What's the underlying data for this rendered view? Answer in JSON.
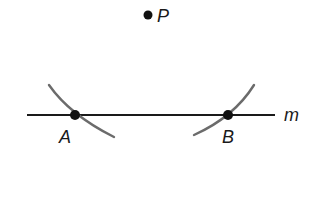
{
  "diagram": {
    "line": {
      "label": "m",
      "x1": 27,
      "y1": 115,
      "x2": 275,
      "y2": 115,
      "color": "#1a1a1a"
    },
    "points": [
      {
        "label": "P",
        "x": 148,
        "y": 15
      },
      {
        "label": "A",
        "x": 75,
        "y": 115
      },
      {
        "label": "B",
        "x": 228,
        "y": 115
      }
    ],
    "arcs": [
      {
        "name": "arc-left",
        "color": "#6b6b6b"
      },
      {
        "name": "arc-right",
        "color": "#6b6b6b"
      }
    ],
    "labels": {
      "P": "P",
      "A": "A",
      "B": "B",
      "m": "m"
    }
  }
}
